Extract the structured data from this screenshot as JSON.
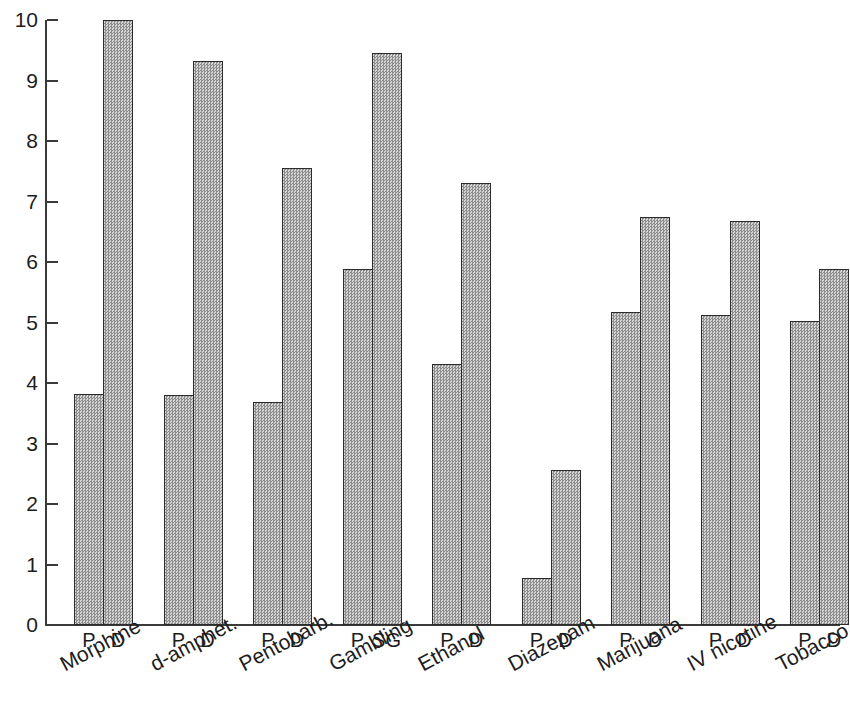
{
  "chart_data": {
    "type": "bar",
    "title": "",
    "xlabel": "",
    "ylabel": "",
    "ylim": [
      0,
      10
    ],
    "yticks": [
      0,
      1,
      2,
      3,
      4,
      5,
      6,
      7,
      8,
      9,
      10
    ],
    "grid": false,
    "legend": null,
    "categories": [
      "Morphine",
      "d-amphet.",
      "Pentobarb.",
      "Gambling",
      "Ethanol",
      "Diazepam",
      "Marijuana",
      "IV nicotine",
      "Tobacco"
    ],
    "groups": [
      {
        "category": "Morphine",
        "bars": [
          {
            "sublabel": "P",
            "value": 3.82
          },
          {
            "sublabel": "D",
            "value": 10.0
          }
        ]
      },
      {
        "category": "d-amphet.",
        "bars": [
          {
            "sublabel": "P",
            "value": 3.8
          },
          {
            "sublabel": "D",
            "value": 9.32
          }
        ]
      },
      {
        "category": "Pentobarb.",
        "bars": [
          {
            "sublabel": "P",
            "value": 3.68
          },
          {
            "sublabel": "D",
            "value": 7.55
          }
        ]
      },
      {
        "category": "Gambling",
        "bars": [
          {
            "sublabel": "P",
            "value": 5.89
          },
          {
            "sublabel": "SG",
            "value": 9.46
          }
        ]
      },
      {
        "category": "Ethanol",
        "bars": [
          {
            "sublabel": "P",
            "value": 4.32
          },
          {
            "sublabel": "D",
            "value": 7.3
          }
        ]
      },
      {
        "category": "Diazepam",
        "bars": [
          {
            "sublabel": "P",
            "value": 0.77
          },
          {
            "sublabel": "D",
            "value": 2.57
          }
        ]
      },
      {
        "category": "Marijuana",
        "bars": [
          {
            "sublabel": "P",
            "value": 5.17
          },
          {
            "sublabel": "D",
            "value": 6.75
          }
        ]
      },
      {
        "category": "IV nicotine",
        "bars": [
          {
            "sublabel": "P",
            "value": 5.12
          },
          {
            "sublabel": "D",
            "value": 6.68
          }
        ]
      },
      {
        "category": "Tobacco",
        "bars": [
          {
            "sublabel": "P",
            "value": 5.02
          },
          {
            "sublabel": "D",
            "value": 5.89
          }
        ]
      }
    ]
  },
  "style": {
    "bar_fill": "#b4b4b4",
    "bar_border": "#2c2c2c",
    "axis_color": "#3a3a3a",
    "text_color": "#1d1d1d",
    "background": "#ffffff"
  }
}
